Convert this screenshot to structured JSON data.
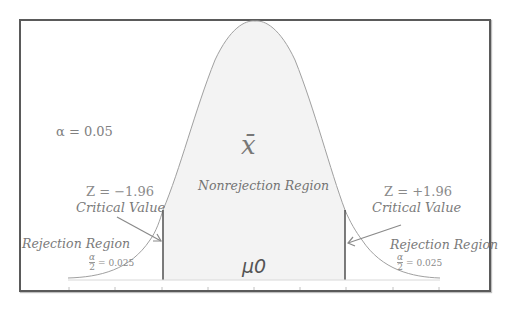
{
  "diagram": {
    "alpha_label": "α = 0.05",
    "sample_mean_symbol": "x̄",
    "nonrejection_label": "Nonrejection Region",
    "mean_symbol": "μ0",
    "left": {
      "z_label": "Z = −1.96",
      "critical_label": "Critical Value",
      "rejection_label": "Rejection Region",
      "alpha_half_num": "α",
      "alpha_half_den": "2",
      "alpha_half_value": "= 0.025"
    },
    "right": {
      "z_label": "Z = +1.96",
      "critical_label": "Critical Value",
      "rejection_label": "Rejection Region",
      "alpha_half_num": "α",
      "alpha_half_den": "2",
      "alpha_half_value": "= 0.025"
    },
    "colors": {
      "frame": "#5a5a5a",
      "curve": "#9a9a9a",
      "nonrejection_fill": "#f3f3f3",
      "critical_line": "#444444",
      "text": "#7a7a7a"
    }
  }
}
